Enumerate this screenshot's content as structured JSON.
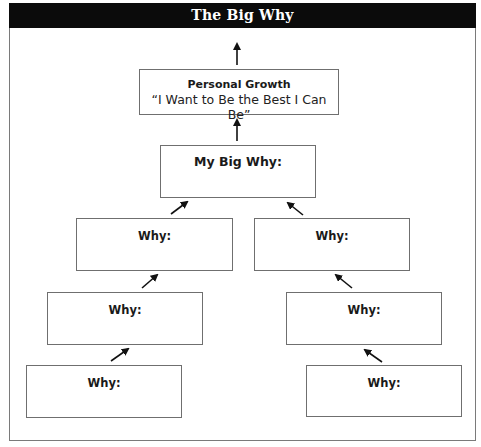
{
  "title": "The Big Why",
  "colors": {
    "header_bg": "#0b0b0b",
    "header_text": "#ffffff",
    "border": "#6f6f6f",
    "arrow": "#111111"
  },
  "top_box": {
    "title": "Personal Growth",
    "subtitle": "“I Want to Be the Best I Can Be”"
  },
  "big_why": {
    "label": "My Big Why:"
  },
  "why_boxes": [
    {
      "label": "Why:"
    },
    {
      "label": "Why:"
    },
    {
      "label": "Why:"
    },
    {
      "label": "Why:"
    },
    {
      "label": "Why:"
    },
    {
      "label": "Why:"
    }
  ]
}
